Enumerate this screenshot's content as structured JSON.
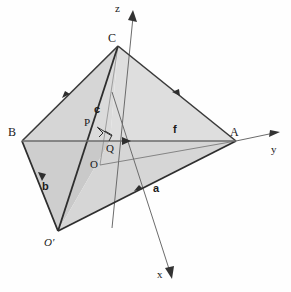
{
  "figure": {
    "type": "3d-geometry-diagram",
    "background_color": "#fefefe",
    "line_color": "#3a3a3a",
    "face_light": "#dcdcdc",
    "face_mid": "#cfcfcf",
    "face_dark": "#c4c4c4",
    "axis_color": "#555555"
  },
  "vertices": [
    {
      "id": "C",
      "label": "C",
      "x": 118,
      "y": 46,
      "lx": 108,
      "ly": 38
    },
    {
      "id": "A",
      "label": "A",
      "x": 236,
      "y": 141,
      "lx": 232,
      "ly": 130
    },
    {
      "id": "B",
      "label": "B",
      "x": 22,
      "y": 141,
      "lx": 10,
      "ly": 130
    },
    {
      "id": "Op",
      "label": "O′",
      "x": 58,
      "y": 231,
      "lx": 44,
      "ly": 237,
      "italic": true
    }
  ],
  "points": [
    {
      "id": "P",
      "label": "P",
      "x": 96,
      "y": 126,
      "lx": 86,
      "ly": 119
    },
    {
      "id": "Q",
      "label": "Q",
      "x": 110,
      "y": 141,
      "lx": 108,
      "ly": 143
    },
    {
      "id": "O",
      "label": "O",
      "x": 100,
      "y": 165,
      "lx": 92,
      "ly": 160
    }
  ],
  "axes": [
    {
      "id": "z",
      "label": "z",
      "lx": 118,
      "ly": 5,
      "from": [
        112,
        228
      ],
      "to": [
        134,
        14
      ]
    },
    {
      "id": "y",
      "label": "y",
      "lx": 272,
      "ly": 148,
      "from": [
        22,
        141
      ],
      "to": [
        278,
        134
      ]
    },
    {
      "id": "x",
      "label": "x",
      "lx": 160,
      "ly": 272,
      "from": [
        112,
        90
      ],
      "to": [
        172,
        278
      ]
    }
  ],
  "vectors": [
    {
      "id": "a",
      "label": "a",
      "lx": 155,
      "ly": 186,
      "bold": true
    },
    {
      "id": "b",
      "label": "b",
      "lx": 44,
      "ly": 184,
      "bold": true
    },
    {
      "id": "c",
      "label": "c",
      "lx": 96,
      "ly": 110,
      "bold": true
    },
    {
      "id": "f",
      "label": "f",
      "lx": 175,
      "ly": 127,
      "bold": true
    }
  ],
  "edges": [
    {
      "from": "B",
      "to": "C",
      "arrow": true
    },
    {
      "from": "C",
      "to": "A",
      "arrow": true
    },
    {
      "from": "B",
      "to": "Op",
      "arrow": true
    },
    {
      "from": "Op",
      "to": "A",
      "arrow": true
    },
    {
      "from": "C",
      "to": "Op",
      "arrow": false
    },
    {
      "from": "B",
      "to": "A",
      "arrow": true
    }
  ],
  "right_angle_marks": [
    {
      "at": "P"
    },
    {
      "at": "Q"
    }
  ]
}
